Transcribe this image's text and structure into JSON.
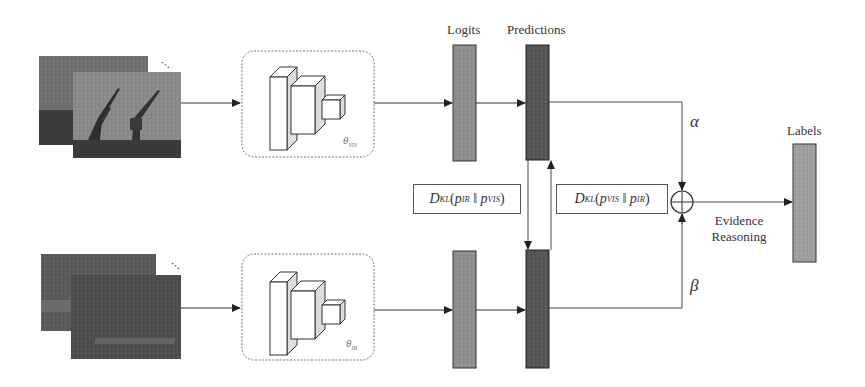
{
  "diagram": {
    "labels": {
      "logits": "Logits",
      "predictions": "Predictions",
      "labels": "Labels",
      "evidence_line1": "Evidence",
      "evidence_line2": "Reasoning"
    },
    "branches": [
      {
        "name": "visible",
        "input": "visible-ship-image-stack",
        "encoder_param": "θ",
        "encoder_param_sub": "VIS"
      },
      {
        "name": "infrared",
        "input": "infrared-ship-image-stack",
        "encoder_param": "θ",
        "encoder_param_sub": "IR"
      }
    ],
    "kl_terms": {
      "left": {
        "D": "D",
        "D_sub": "KL",
        "p1": "p",
        "p1_sub": "IR",
        "sep": "‖",
        "p2": "p",
        "p2_sub": "VIS"
      },
      "right": {
        "D": "D",
        "D_sub": "KL",
        "p1": "p",
        "p1_sub": "VIS",
        "sep": "‖",
        "p2": "p",
        "p2_sub": "IR"
      }
    },
    "weights": {
      "alpha": "α",
      "beta": "β"
    },
    "fusion_symbol": "oplus",
    "ellipsis": "⋯",
    "colors": {
      "logits_fill": "#8f8f8f",
      "predictions_fill": "#555555",
      "labels_fill": "#a0a0a0",
      "line": "#444444",
      "dashed_box": "#777777"
    }
  }
}
